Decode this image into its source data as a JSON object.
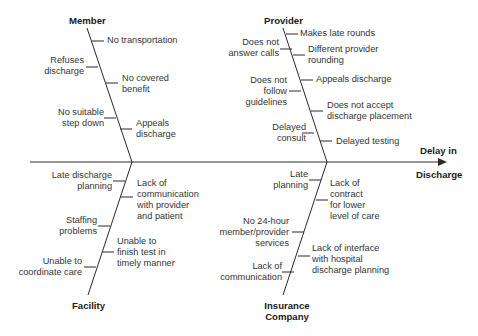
{
  "diagram": {
    "type": "fishbone",
    "effect": {
      "line1": "Delay in",
      "line2": "Discharge"
    },
    "categories": {
      "member": {
        "label": "Member",
        "causes": [
          "No transportation",
          "Refuses discharge",
          "No covered benefit",
          "No suitable step down",
          "Appeals discharge"
        ]
      },
      "provider": {
        "label": "Provider",
        "causes": [
          "Makes late rounds",
          "Does not answer calls",
          "Different provider rounding",
          "Does not follow guidelines",
          "Appeals discharge",
          "Does not accept discharge placement",
          "Delayed consult",
          "Delayed testing"
        ]
      },
      "facility": {
        "label": "Facility",
        "causes": [
          "Late discharge planning",
          "Lack of communication with provider and patient",
          "Staffing problems",
          "Unable to finish test in timely manner",
          "Unable to coordinate care"
        ]
      },
      "insurance": {
        "label1": "Insurance",
        "label2": "Company",
        "causes": [
          "Late planning",
          "Lack of contract for lower level of care",
          "No 24-hour member/provider services",
          "Lack of interface with hospital discharge planning",
          "Lack of communication"
        ]
      }
    }
  },
  "text": {
    "m_label": "Member",
    "m_c1": "No transportation",
    "m_c2a": "Refuses",
    "m_c2b": "discharge",
    "m_c3a": "No covered",
    "m_c3b": "benefit",
    "m_c4a": "No suitable",
    "m_c4b": "step down",
    "m_c5a": "Appeals",
    "m_c5b": "discharge",
    "p_label": "Provider",
    "p_c1": "Makes late rounds",
    "p_c2a": "Does not",
    "p_c2b": "answer calls",
    "p_c3a": "Different provider",
    "p_c3b": "rounding",
    "p_c4a": "Does not",
    "p_c4b": "follow",
    "p_c4c": "guidelines",
    "p_c5": "Appeals discharge",
    "p_c6a": "Does not accept",
    "p_c6b": "discharge placement",
    "p_c7a": "Delayed",
    "p_c7b": "consult",
    "p_c8": "Delayed testing",
    "f_label": "Facility",
    "f_c1a": "Late discharge",
    "f_c1b": "planning",
    "f_c2a": "Lack of",
    "f_c2b": "communication",
    "f_c2c": "with provider",
    "f_c2d": "and patient",
    "f_c3a": "Staffing",
    "f_c3b": "problems",
    "f_c4a": "Unable to",
    "f_c4b": "finish test in",
    "f_c4c": "timely manner",
    "f_c5a": "Unable to",
    "f_c5b": "coordinate care",
    "i_label1": "Insurance",
    "i_label2": "Company",
    "i_c1a": "Late",
    "i_c1b": "planning",
    "i_c2a": "Lack of",
    "i_c2b": "contract",
    "i_c2c": "for lower",
    "i_c2d": "level of care",
    "i_c3a": "No 24-hour",
    "i_c3b": "member/provider",
    "i_c3c": "services",
    "i_c4a": "Lack of interface",
    "i_c4b": "with hospital",
    "i_c4c": "discharge planning",
    "i_c5a": "Lack of",
    "i_c5b": "communication",
    "effect1": "Delay in",
    "effect2": "Discharge"
  },
  "colors": {
    "line": "#2a2a2a",
    "text": "#333333",
    "background": "#ffffff"
  }
}
